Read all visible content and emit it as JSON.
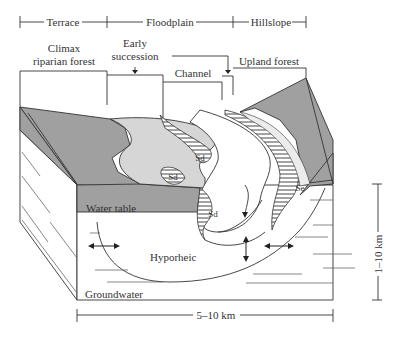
{
  "figure": {
    "type": "block-diagram"
  },
  "zones": {
    "terrace": "Terrace",
    "floodplain": "Floodplain",
    "hillslope": "Hillslope"
  },
  "vegetation": {
    "climax_line1": "Climax",
    "climax_line2": "riparian forest",
    "early_line1": "Early",
    "early_line2": "succession",
    "channel": "Channel",
    "upland": "Upland forest"
  },
  "labels": {
    "water_table": "Water table",
    "hyporheic": "Hyporheic",
    "groundwater": "Groundwater",
    "sd": "Sd",
    "se": "Se"
  },
  "scale": {
    "width": "5–10 km",
    "depth": "1–10 km"
  },
  "colors": {
    "dark_gray": "#a0a0a0",
    "light_gray": "#d6d6d6",
    "very_light": "#ececec",
    "line": "#333333",
    "background": "#ffffff"
  }
}
